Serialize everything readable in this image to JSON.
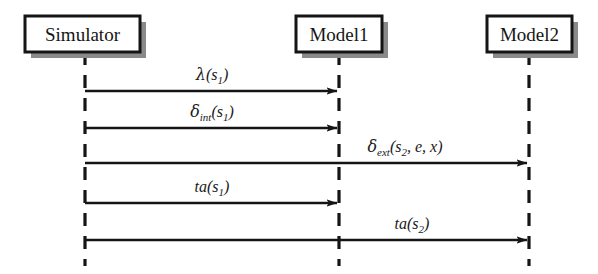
{
  "diagram": {
    "type": "sequence-diagram",
    "background_color": "#ffffff",
    "line_color": "#151515",
    "shadow_color": "#8a8a8a",
    "box_fill": "#ffffff"
  },
  "lifelines": [
    {
      "id": "simulator",
      "label": "Simulator",
      "x": 85,
      "box": {
        "x": 25,
        "y": 16,
        "width": 115,
        "height": 36
      }
    },
    {
      "id": "model1",
      "label": "Model1",
      "x": 339,
      "box": {
        "x": 296,
        "y": 16,
        "width": 86,
        "height": 36
      }
    },
    {
      "id": "model2",
      "label": "Model2",
      "x": 529,
      "box": {
        "x": 487,
        "y": 16,
        "width": 85,
        "height": 36
      }
    }
  ],
  "messages": [
    {
      "id": "lambda-s1",
      "label": "λ(s₁)",
      "label_parts": {
        "fn": "λ",
        "sub": "",
        "args": "(s",
        "arg_sub": "1",
        "close": ")"
      },
      "from": "simulator",
      "to": "model1",
      "y": 91,
      "label_x": 212,
      "label_y": 80
    },
    {
      "id": "delta-int-s1",
      "label": "δint(s₁)",
      "label_parts": {
        "fn": "δ",
        "sub": "int",
        "args": "(s",
        "arg_sub": "1",
        "close": ")"
      },
      "from": "simulator",
      "to": "model1",
      "y": 128,
      "label_x": 212,
      "label_y": 117
    },
    {
      "id": "delta-ext-s2-e-x",
      "label": "δext(s₂, e, x)",
      "label_parts": {
        "fn": "δ",
        "sub": "ext",
        "args": "(s",
        "arg_sub": "2",
        "close": ", e, x)"
      },
      "from": "simulator",
      "to": "model2",
      "y": 163,
      "label_x": 405,
      "label_y": 152
    },
    {
      "id": "ta-s1",
      "label": "ta(s₁)",
      "label_parts": {
        "fn": "ta",
        "sub": "",
        "args": "(s",
        "arg_sub": "1",
        "close": ")"
      },
      "from": "simulator",
      "to": "model1",
      "y": 203,
      "label_x": 212,
      "label_y": 192
    },
    {
      "id": "ta-s2",
      "label": "ta(s₂)",
      "label_parts": {
        "fn": "ta",
        "sub": "",
        "args": "(s",
        "arg_sub": "2",
        "close": ")"
      },
      "from": "simulator",
      "to": "model2",
      "y": 240,
      "label_x": 412,
      "label_y": 229
    }
  ],
  "lifeline_extent": {
    "top": 52,
    "bottom": 266
  }
}
